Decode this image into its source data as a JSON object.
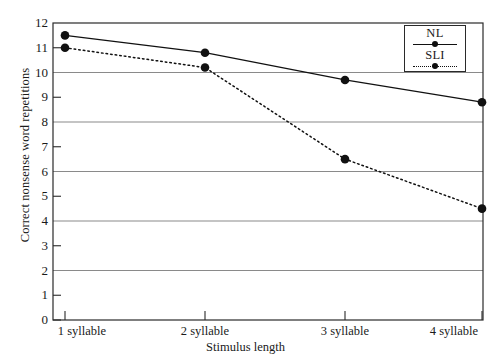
{
  "chart_data": {
    "type": "line",
    "title": "",
    "xlabel": "Stimulus length",
    "ylabel": "Correct nonsense word repetitions",
    "categories": [
      "1 syllable",
      "2 syllable",
      "3 syllable",
      "4 syllable"
    ],
    "ylim": [
      0,
      12
    ],
    "ytick_labels": [
      "0",
      "1",
      "2",
      "3",
      "4",
      "5",
      "6",
      "7",
      "8",
      "9",
      "10",
      "11",
      "12"
    ],
    "yticks": [
      0,
      1,
      2,
      3,
      4,
      5,
      6,
      7,
      8,
      9,
      10,
      11,
      12
    ],
    "gridlines": [
      2,
      4,
      6,
      8,
      10,
      12
    ],
    "grid": true,
    "legend_position": "top-right",
    "series": [
      {
        "name": "NL",
        "values": [
          11.5,
          10.8,
          9.7,
          8.8
        ],
        "line_style": "solid",
        "marker": "circle",
        "color": "#111111"
      },
      {
        "name": "SLI",
        "values": [
          11.0,
          10.2,
          6.5,
          4.5
        ],
        "line_style": "dotted",
        "marker": "circle",
        "color": "#111111"
      }
    ]
  },
  "axes": {
    "y_title": "Correct nonsense word repetitions",
    "x_title": "Stimulus length"
  },
  "legend": {
    "entries": [
      {
        "label": "NL",
        "style": "solid"
      },
      {
        "label": "SLI",
        "style": "dotted"
      }
    ]
  },
  "colors": {
    "ink": "#111111",
    "grid": "#8a8a8a",
    "axis": "#2a2a2a",
    "background": "#ffffff"
  }
}
